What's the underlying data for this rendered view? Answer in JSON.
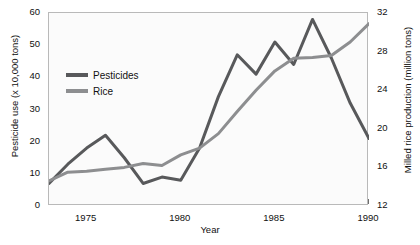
{
  "chart_data": {
    "type": "line",
    "title": "",
    "xlabel": "Year",
    "ylabel": "Pesticide use (x 10,000 tons)",
    "y2label": "Milled rice production (million tons)",
    "x": [
      1973,
      1974,
      1975,
      1976,
      1977,
      1978,
      1979,
      1980,
      1981,
      1982,
      1983,
      1984,
      1985,
      1986,
      1987,
      1988,
      1989,
      1990
    ],
    "xlim": [
      1973,
      1990
    ],
    "xticks": [
      1975,
      1980,
      1985,
      1990
    ],
    "xtick_labels": [
      "1975",
      "1980",
      "1985",
      "1990"
    ],
    "ylim": [
      0,
      60
    ],
    "yticks": [
      0,
      10,
      20,
      30,
      40,
      50,
      60
    ],
    "ytick_labels": [
      "0",
      "10",
      "20",
      "30",
      "40",
      "50",
      "60"
    ],
    "y2lim": [
      12,
      32
    ],
    "y2ticks": [
      12,
      16,
      20,
      24,
      28,
      32
    ],
    "y2tick_labels": [
      "12",
      "16",
      "20",
      "24",
      "28",
      "32"
    ],
    "grid": false,
    "legend_position": "upper left",
    "series": [
      {
        "name": "Pesticides",
        "axis": "left",
        "color": "#58595b",
        "unit": "x 10,000 tons",
        "values": [
          7,
          13,
          18,
          22,
          15,
          7,
          9,
          8,
          18,
          34,
          47,
          41,
          51,
          44,
          58,
          46,
          32,
          21
        ]
      },
      {
        "name": "Rice",
        "axis": "right",
        "color": "#8d8e90",
        "unit": "million tons",
        "values": [
          14.6,
          15.5,
          15.6,
          15.8,
          16.0,
          16.4,
          16.2,
          17.3,
          18.0,
          19.5,
          21.8,
          24.0,
          26.0,
          27.3,
          27.4,
          27.6,
          29.0,
          30.9
        ]
      }
    ],
    "legend": [
      {
        "label": "Pesticides",
        "color": "#58595b"
      },
      {
        "label": "Rice",
        "color": "#8d8e90"
      }
    ]
  }
}
